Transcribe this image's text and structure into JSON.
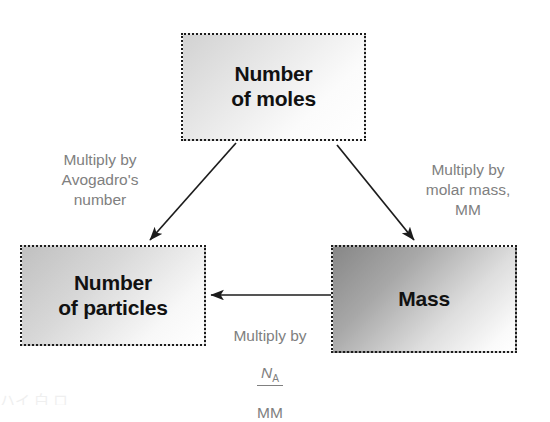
{
  "diagram": {
    "type": "flow-diagram",
    "background_color": "#ffffff",
    "node_text_color": "#111111",
    "label_text_color": "#808080",
    "arrow_color": "#1c1c1c",
    "border_style": "dotted",
    "nodes": [
      {
        "id": "moles",
        "label": "Number\nof moles",
        "gradient_from": "#d2d2d2",
        "gradient_to": "#ffffff"
      },
      {
        "id": "particles",
        "label": "Number\nof particles",
        "gradient_from": "#c0c0c0",
        "gradient_to": "#ffffff"
      },
      {
        "id": "mass",
        "label": "Mass",
        "gradient_from": "#878787",
        "gradient_to": "#ffffff"
      }
    ],
    "edges": [
      {
        "id": "moles-to-particles",
        "from": "moles",
        "to": "particles",
        "label": "Multiply by\nAvogadro's\nnumber"
      },
      {
        "id": "moles-to-mass",
        "from": "moles",
        "to": "mass",
        "label": "Multiply by\nmolar mass,\nMM"
      },
      {
        "id": "mass-to-particles",
        "from": "mass",
        "to": "particles",
        "label": "Multiply by",
        "fraction_numerator": "N",
        "fraction_numerator_subscript": "A",
        "fraction_denominator": "MM"
      }
    ]
  },
  "caption": {
    "remnant_text": "ハイ 白 ロ"
  }
}
